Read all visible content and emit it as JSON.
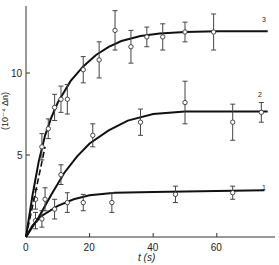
{
  "chart_data": {
    "type": "scatter",
    "title": "",
    "xlabel": "t (s)",
    "ylabel": "(10^-4 Δn)",
    "xlim": [
      0,
      76
    ],
    "ylim": [
      0,
      13.5
    ],
    "xticks": [
      0,
      20,
      40,
      60
    ],
    "yticks": [
      5,
      10
    ],
    "grid": false,
    "series": [
      {
        "name": "1",
        "points": [
          {
            "t": 3,
            "v": 1.0,
            "err": 0.5
          },
          {
            "t": 5,
            "v": 1.1,
            "err": 0.5
          },
          {
            "t": 9,
            "v": 1.7,
            "err": 0.6
          },
          {
            "t": 13,
            "v": 2.1,
            "err": 0.6
          },
          {
            "t": 18,
            "v": 2.1,
            "err": 0.5
          },
          {
            "t": 27,
            "v": 2.1,
            "err": 0.6
          },
          {
            "t": 47,
            "v": 2.6,
            "err": 0.5
          },
          {
            "t": 65,
            "v": 2.7,
            "err": 0.4
          }
        ],
        "curve": [
          [
            0,
            0
          ],
          [
            2,
            0.7
          ],
          [
            5,
            1.3
          ],
          [
            10,
            1.9
          ],
          [
            15,
            2.3
          ],
          [
            20,
            2.55
          ],
          [
            28,
            2.7
          ],
          [
            40,
            2.75
          ],
          [
            60,
            2.8
          ],
          [
            75,
            2.85
          ]
        ]
      },
      {
        "name": "2",
        "points": [
          {
            "t": 3,
            "v": 2.3,
            "err": 0.6
          },
          {
            "t": 6,
            "v": 2.3,
            "err": 0.7
          },
          {
            "t": 11,
            "v": 3.8,
            "err": 0.6
          },
          {
            "t": 21,
            "v": 6.2,
            "err": 0.7
          },
          {
            "t": 36,
            "v": 7.0,
            "err": 0.8
          },
          {
            "t": 50,
            "v": 8.2,
            "err": 1.3
          },
          {
            "t": 65,
            "v": 7.0,
            "err": 1.1
          },
          {
            "t": 74,
            "v": 7.6,
            "err": 0.6
          }
        ],
        "curve": [
          [
            0,
            0
          ],
          [
            4,
            1.2
          ],
          [
            8,
            2.6
          ],
          [
            12,
            3.9
          ],
          [
            16,
            4.9
          ],
          [
            20,
            5.7
          ],
          [
            26,
            6.5
          ],
          [
            32,
            7.1
          ],
          [
            40,
            7.5
          ],
          [
            50,
            7.65
          ],
          [
            60,
            7.65
          ],
          [
            76,
            7.65
          ]
        ]
      },
      {
        "name": "3",
        "points": [
          {
            "t": 5,
            "v": 5.5,
            "err": 0.8
          },
          {
            "t": 7,
            "v": 6.6,
            "err": 0.6
          },
          {
            "t": 9,
            "v": 7.9,
            "err": 0.8
          },
          {
            "t": 11,
            "v": 8.4,
            "err": 0.8
          },
          {
            "t": 13,
            "v": 8.4,
            "err": 0.9
          },
          {
            "t": 18,
            "v": 10.2,
            "err": 0.8
          },
          {
            "t": 23,
            "v": 10.8,
            "err": 1.1
          },
          {
            "t": 28,
            "v": 12.6,
            "err": 1.2
          },
          {
            "t": 33,
            "v": 11.6,
            "err": 1.0
          },
          {
            "t": 38,
            "v": 12.2,
            "err": 0.6
          },
          {
            "t": 43,
            "v": 12.2,
            "err": 0.8
          },
          {
            "t": 50,
            "v": 12.5,
            "err": 0.6
          },
          {
            "t": 59,
            "v": 12.5,
            "err": 1.1
          }
        ],
        "curve": [
          [
            0,
            0
          ],
          [
            2,
            2.5
          ],
          [
            4,
            4.6
          ],
          [
            6,
            6.2
          ],
          [
            8,
            7.3
          ],
          [
            10,
            8.2
          ],
          [
            14,
            9.5
          ],
          [
            18,
            10.4
          ],
          [
            22,
            11.1
          ],
          [
            26,
            11.6
          ],
          [
            30,
            11.95
          ],
          [
            36,
            12.25
          ],
          [
            42,
            12.4
          ],
          [
            50,
            12.5
          ],
          [
            60,
            12.55
          ],
          [
            76,
            12.55
          ]
        ],
        "dashed_start": [
          [
            0,
            0
          ],
          [
            6,
            5.5
          ]
        ]
      }
    ]
  },
  "axes": {
    "x_ticks": [
      "0",
      "20",
      "40",
      "60"
    ],
    "y_ticks": [
      "5",
      "10"
    ],
    "x_label": "t  (s)",
    "y_label": "(10⁻⁴ Δn)"
  },
  "curve_labels": [
    "1",
    "2",
    "3"
  ]
}
